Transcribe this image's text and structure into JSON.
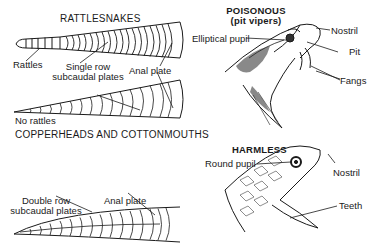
{
  "left_panel": {
    "rattlesnakes": {
      "heading": "RATTLESNAKES",
      "labels": {
        "rattles": "Rattles",
        "single_row_line1": "Single row",
        "single_row_line2": "subcaudal plates",
        "anal_plate": "Anal plate",
        "no_rattles": "No rattles"
      }
    },
    "copperheads": {
      "heading": "COPPERHEADS AND COTTONMOUTHS",
      "labels": {
        "double_row_line1": "Double row",
        "double_row_line2": "subcaudal plates",
        "anal_plate": "Anal plate"
      }
    }
  },
  "right_panel": {
    "poisonous": {
      "heading": "POISONOUS",
      "subheading": "(pit vipers)",
      "labels": {
        "elliptical_pupil": "Elliptical pupil",
        "nostril": "Nostril",
        "pit": "Pit",
        "fangs": "Fangs"
      }
    },
    "harmless": {
      "heading": "HARMLESS",
      "labels": {
        "round_pupil": "Round pupil",
        "nostril": "Nostril",
        "teeth": "Teeth"
      }
    }
  },
  "colors": {
    "ink": "#1a1a1a",
    "background": "#ffffff"
  }
}
